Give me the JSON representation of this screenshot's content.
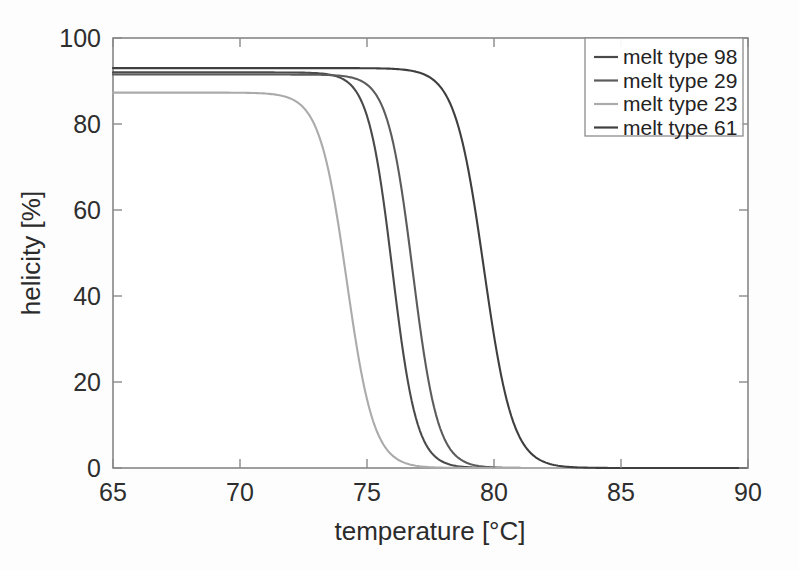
{
  "chart_data": {
    "type": "line",
    "title": "",
    "xlabel": "temperature [°C]",
    "ylabel": "helicity [%]",
    "xlim": [
      65,
      90
    ],
    "ylim": [
      0,
      100
    ],
    "xticks": [
      65,
      70,
      75,
      80,
      85,
      90
    ],
    "yticks": [
      0,
      20,
      40,
      60,
      80,
      100
    ],
    "xtick_labels": [
      "65",
      "70",
      "75",
      "80",
      "85",
      "90"
    ],
    "ytick_labels": [
      "0",
      "20",
      "40",
      "60",
      "80",
      "100"
    ],
    "grid": false,
    "legend_position": "top-right",
    "x": [
      65,
      66,
      67,
      68,
      69,
      70,
      71,
      72,
      73,
      74,
      75,
      76,
      77,
      78,
      79,
      80,
      81,
      82,
      83,
      84,
      85,
      86,
      87,
      88,
      89,
      90
    ],
    "series": [
      {
        "name": "melt type 98",
        "color": "#4a4a4a",
        "plateau": 92.0,
        "midpoint": 76.0,
        "slope": 0.95,
        "values": [
          91.9,
          91.8,
          91.7,
          91.5,
          91.2,
          90.7,
          89.8,
          87.9,
          84.1,
          77.0,
          65.5,
          50.6,
          35.4,
          22.8,
          13.6,
          7.7,
          4.2,
          2.2,
          1.2,
          0.6,
          0.3,
          0.2,
          0.1,
          0.1,
          0.0,
          0.0
        ]
      },
      {
        "name": "melt type 29",
        "color": "#5c5c5c",
        "plateau": 91.5,
        "midpoint": 76.8,
        "slope": 0.92,
        "values": [
          91.4,
          91.3,
          91.2,
          91.0,
          90.7,
          90.2,
          89.3,
          87.6,
          84.2,
          78.1,
          68.1,
          54.4,
          39.4,
          26.1,
          16.0,
          9.3,
          5.2,
          2.8,
          1.5,
          0.8,
          0.4,
          0.2,
          0.1,
          0.1,
          0.0,
          0.0
        ]
      },
      {
        "name": "melt type 23",
        "color": "#ababab",
        "plateau": 87.3,
        "midpoint": 74.2,
        "slope": 0.85,
        "values": [
          86.9,
          86.6,
          86.1,
          85.3,
          83.9,
          81.5,
          77.5,
          71.2,
          62.3,
          50.8,
          38.4,
          26.9,
          17.6,
          10.9,
          6.5,
          3.8,
          2.1,
          1.2,
          0.7,
          0.4,
          0.2,
          0.1,
          0.1,
          0.0,
          0.0,
          0.0
        ]
      },
      {
        "name": "melt type 61",
        "color": "#3f3f3f",
        "plateau": 93.0,
        "midpoint": 79.6,
        "slope": 0.8,
        "values": [
          93.0,
          92.9,
          92.9,
          92.8,
          92.7,
          92.5,
          92.2,
          91.7,
          90.8,
          89.2,
          86.5,
          82.1,
          75.5,
          66.2,
          54.5,
          41.7,
          29.8,
          20.1,
          12.9,
          7.9,
          4.7,
          2.8,
          1.6,
          0.9,
          0.5,
          0.3
        ]
      }
    ]
  },
  "legend": {
    "entries": [
      {
        "label": "melt type 98"
      },
      {
        "label": "melt type 29"
      },
      {
        "label": "melt type 23"
      },
      {
        "label": "melt type 61"
      }
    ]
  }
}
